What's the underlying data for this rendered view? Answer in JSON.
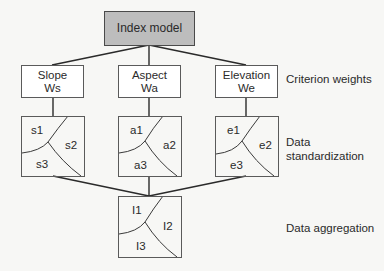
{
  "root": {
    "label": "Index model",
    "fill": "#bdbdbd"
  },
  "criteria": [
    {
      "name": "Slope",
      "weight": "Ws"
    },
    {
      "name": "Aspect",
      "weight": "Wa"
    },
    {
      "name": "Elevation",
      "weight": "We"
    }
  ],
  "standardization": [
    {
      "r1": "s1",
      "r2": "s2",
      "r3": "s3"
    },
    {
      "r1": "a1",
      "r2": "a2",
      "r3": "a3"
    },
    {
      "r1": "e1",
      "r2": "e2",
      "r3": "e3"
    }
  ],
  "aggregation": {
    "r1": "I1",
    "r2": "I2",
    "r3": "I3"
  },
  "side_labels": {
    "criterion_weights": "Criterion weights",
    "data_standardization_line1": "Data",
    "data_standardization_line2": "standardization",
    "data_aggregation": "Data aggregation"
  },
  "colors": {
    "background": "#f7f7f5",
    "stroke": "#2a2a2a",
    "box_border": "#5a5a5a"
  }
}
